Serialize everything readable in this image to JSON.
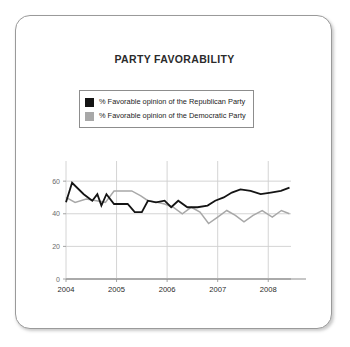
{
  "card": {
    "title": "PARTY FAVORABILITY"
  },
  "legend": {
    "position": "top-center",
    "entries": [
      {
        "label": "% Favorable opinion of the Republican Party",
        "color": "#141414",
        "swatch": "legend-swatch-republican"
      },
      {
        "label": "% Favorable opinion of the Democratic Party",
        "color": "#a8a8a8",
        "swatch": "legend-swatch-democratic"
      }
    ]
  },
  "chart_data": {
    "type": "line",
    "title": "PARTY FAVORABILITY",
    "xlabel": "",
    "ylabel": "",
    "ylim": [
      0,
      65
    ],
    "yticks": [
      0,
      20,
      40,
      60
    ],
    "ytick_labels": [
      "0",
      "20",
      "40",
      "60"
    ],
    "xlim": [
      2004.0,
      2008.45
    ],
    "xticks": [
      2004,
      2005,
      2006,
      2007,
      2008
    ],
    "xtick_labels": [
      "2004",
      "2005",
      "2006",
      "2007",
      "2008"
    ],
    "grid": true,
    "legend_position": "top-center",
    "series": [
      {
        "name": "% Favorable opinion of the Republican Party",
        "color": "#141414",
        "x": [
          2004.0,
          2004.12,
          2004.35,
          2004.52,
          2004.62,
          2004.7,
          2004.8,
          2004.95,
          2005.22,
          2005.36,
          2005.5,
          2005.62,
          2005.78,
          2005.95,
          2006.08,
          2006.22,
          2006.4,
          2006.6,
          2006.8,
          2006.95,
          2007.12,
          2007.28,
          2007.45,
          2007.65,
          2007.85,
          2008.05,
          2008.25,
          2008.42
        ],
        "values": [
          47,
          59,
          52,
          48,
          52,
          45,
          52,
          46,
          46,
          41,
          41,
          48,
          47,
          48,
          44,
          48,
          44,
          44,
          45,
          48,
          50,
          53,
          55,
          54,
          52,
          53,
          54,
          56
        ]
      },
      {
        "name": "% Favorable opinion of the Democratic Party",
        "color": "#a8a8a8",
        "x": [
          2004.0,
          2004.18,
          2004.4,
          2004.6,
          2004.78,
          2004.95,
          2005.1,
          2005.3,
          2005.48,
          2005.62,
          2005.8,
          2005.95,
          2006.12,
          2006.3,
          2006.48,
          2006.65,
          2006.82,
          2007.0,
          2007.18,
          2007.35,
          2007.52,
          2007.7,
          2007.88,
          2008.08,
          2008.26,
          2008.42
        ],
        "values": [
          50,
          47,
          49,
          48,
          47,
          54,
          54,
          54,
          51,
          48,
          47,
          46,
          44,
          40,
          44,
          41,
          34,
          38,
          42,
          39,
          35,
          39,
          42,
          38,
          42,
          40
        ]
      }
    ]
  }
}
